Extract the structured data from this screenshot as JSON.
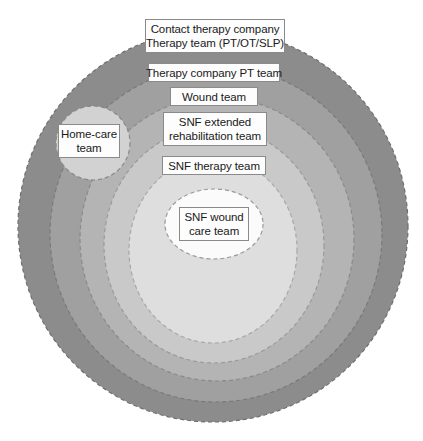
{
  "diagram": {
    "type": "concentric-circles",
    "title": "",
    "background_color": "#ffffff",
    "rings": [
      {
        "name": "contact-therapy-company",
        "label_lines": [
          "Contact therapy company",
          "Therapy team (PT/OT/SLP)"
        ],
        "fill_color": "#8c8c8c",
        "border_color": "#6e6e6e",
        "border_style": "dashed",
        "level": 1
      },
      {
        "name": "therapy-company-pt-team",
        "label_lines": [
          "Therapy company PT team"
        ],
        "fill_color": "#a0a0a0",
        "border_color": "#7a7a7a",
        "border_style": "dashed",
        "level": 2
      },
      {
        "name": "wound-team",
        "label_lines": [
          "Wound team"
        ],
        "fill_color": "#b4b4b4",
        "border_color": "#8a8a8a",
        "border_style": "dashed",
        "level": 3
      },
      {
        "name": "snf-extended-rehabilitation-team",
        "label_lines": [
          "SNF extended",
          "rehabilitation team"
        ],
        "fill_color": "#c9c9c9",
        "border_color": "#9a9a9a",
        "border_style": "dashed",
        "level": 4
      },
      {
        "name": "snf-therapy-team",
        "label_lines": [
          "SNF therapy team"
        ],
        "fill_color": "#dedede",
        "border_color": "#a8a8a8",
        "border_style": "dashed",
        "level": 5
      },
      {
        "name": "snf-wound-care-team",
        "label_lines": [
          "SNF wound",
          "care team"
        ],
        "fill_color": "#fbfbfb",
        "border_color": "#9a9a9a",
        "border_style": "dashed",
        "level": 6
      }
    ],
    "satellite": {
      "name": "home-care-team",
      "label_lines": [
        "Home-care",
        "team"
      ],
      "fill_color": "#d2d2d2",
      "border_color": "#8a8a8a",
      "border_style": "dashed"
    },
    "label_box_style": {
      "background": "#fdfdfd",
      "border_color": "#8a8a8a",
      "text_color": "#1a1a1a"
    }
  }
}
